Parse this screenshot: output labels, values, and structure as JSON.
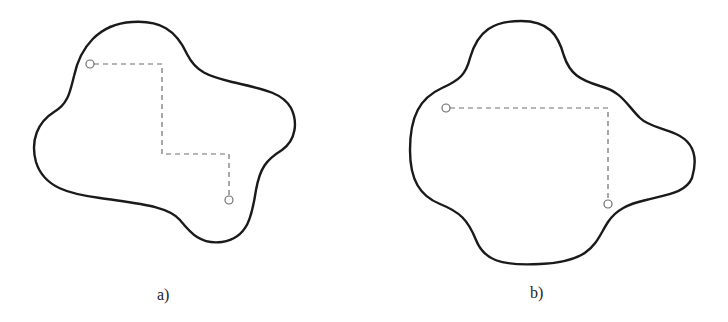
{
  "figure": {
    "panels": [
      {
        "id": "a",
        "label": "a)",
        "description": "Irregular closed blob with a three-segment staircase dashed path between two points",
        "path_segments": 5,
        "start_point": [
          90,
          64
        ],
        "end_point": [
          229,
          200
        ]
      },
      {
        "id": "b",
        "label": "b)",
        "description": "Irregular closed blob with an L-shaped dashed path between two points",
        "path_segments": 2,
        "start_point": [
          446,
          108
        ],
        "end_point": [
          608,
          204
        ]
      }
    ],
    "colors": {
      "outline": "#1a1a1a",
      "dashed_path": "#6e6e6e",
      "point_marker": "#6e6e6e",
      "background": "#ffffff"
    }
  }
}
